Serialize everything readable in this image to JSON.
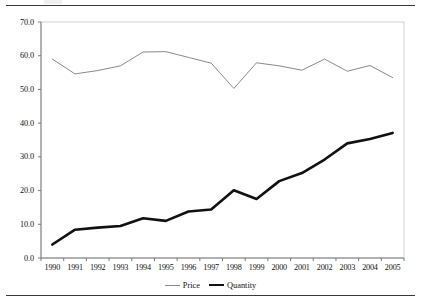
{
  "figure": {
    "has_top_rule": true,
    "has_bottom_rule": true
  },
  "chart_data": {
    "type": "line",
    "title": "",
    "subtitle": "",
    "xlabel": "",
    "ylabel": "",
    "categories": [
      "1990",
      "1991",
      "1992",
      "1993",
      "1994",
      "1995",
      "1996",
      "1997",
      "1998",
      "1999",
      "2000",
      "2001",
      "2002",
      "2003",
      "2004",
      "2005"
    ],
    "x": [
      1990,
      1991,
      1992,
      1993,
      1994,
      1995,
      1996,
      1997,
      1998,
      1999,
      2000,
      2001,
      2002,
      2003,
      2004,
      2005
    ],
    "series": [
      {
        "name": "Price",
        "color": "#8a8a8a",
        "line_width": 1,
        "values": [
          59.0,
          54.6,
          55.6,
          57.0,
          61.1,
          61.2,
          59.5,
          57.8,
          50.3,
          57.9,
          57.0,
          55.7,
          59.0,
          55.4,
          57.1,
          53.5
        ]
      },
      {
        "name": "Quantity",
        "color": "#111111",
        "line_width": 2.6,
        "values": [
          4.0,
          8.4,
          9.0,
          9.5,
          11.8,
          11.0,
          13.8,
          14.4,
          20.1,
          17.5,
          22.8,
          25.2,
          29.2,
          34.0,
          35.3,
          37.1
        ]
      }
    ],
    "ylim": [
      0.0,
      70.0
    ],
    "ytick_values": [
      0.0,
      10.0,
      20.0,
      30.0,
      40.0,
      50.0,
      60.0,
      70.0
    ],
    "ytick_labels": [
      "0.0",
      "10.0",
      "20.0",
      "30.0",
      "40.0",
      "50.0",
      "60.0",
      "70.0"
    ],
    "xtick_labels": [
      "1990",
      "1991",
      "1992",
      "1993",
      "1994",
      "1995",
      "1996",
      "1997",
      "1998",
      "1999",
      "2000",
      "2001",
      "2002",
      "2003",
      "2004",
      "2005"
    ],
    "grid": false,
    "legend_position": "bottom-center",
    "legend_entries": [
      "Price",
      "Quantity"
    ],
    "plot_border_color": "#c8c8c8",
    "axis_color": "#7a7a7a"
  }
}
